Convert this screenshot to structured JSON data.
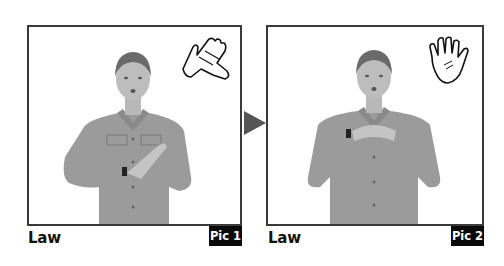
{
  "panels": [
    {
      "caption": "Law",
      "badge": "Pic 1",
      "hand_icon": "two-hands-clap-icon",
      "description": "Woman signing, right hand flat on left palm at chest level"
    },
    {
      "caption": "Law",
      "badge": "Pic 2",
      "hand_icon": "open-hand-icon",
      "description": "Woman signing, fingers of both hands interlocked at chest"
    }
  ],
  "arrow": {
    "icon": "arrow-right-icon",
    "color": "#555555"
  },
  "colors": {
    "frame": "#3a3a3a",
    "badge_bg": "#0a0a0a",
    "badge_text": "#ffffff",
    "shirt": "#9a9a9a"
  }
}
